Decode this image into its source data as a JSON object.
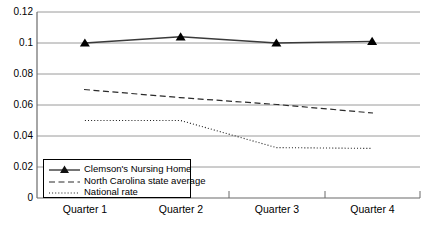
{
  "chart_data": {
    "type": "line",
    "title": "",
    "subtitle": "",
    "xlabel": "",
    "ylabel": "",
    "categories": [
      "Quarter 1",
      "Quarter 2",
      "Quarter 3",
      "Quarter 4"
    ],
    "ylim": [
      0,
      0.12
    ],
    "ytick_labels": [
      "0",
      "0.02",
      "0.04",
      "0.06",
      "0.08",
      "0.1",
      "0.12"
    ],
    "ytick_values": [
      0,
      0.02,
      0.04,
      0.06,
      0.08,
      0.1,
      0.12
    ],
    "grid": true,
    "grid_axis": "y",
    "legend_position": "inside-bottom-left",
    "series": [
      {
        "name": "Clemson's Nursing Home",
        "values": [
          0.1,
          0.104,
          0.1,
          0.101
        ],
        "style": "solid",
        "marker": "triangle",
        "color": "#000000"
      },
      {
        "name": "North Carolina state average",
        "values": [
          0.07,
          0.0635,
          0.059,
          0.0545
        ],
        "style": "dashed",
        "marker": "none",
        "color": "#000000"
      },
      {
        "name": "National rate",
        "values": [
          0.05,
          0.05,
          0.0325,
          0.032
        ],
        "style": "dotted",
        "marker": "none",
        "color": "#000000"
      }
    ]
  },
  "legend": {
    "items": [
      {
        "label": "Clemson's Nursing Home",
        "sample": "solid-line-with-triangle-marker"
      },
      {
        "label": "North Carolina state average",
        "sample": "dashed-line"
      },
      {
        "label": "National rate",
        "sample": "dotted-line"
      }
    ]
  },
  "axes": {
    "y": {
      "ticks": [
        {
          "label": "0.12"
        },
        {
          "label": "0.1"
        },
        {
          "label": "0.08"
        },
        {
          "label": "0.06"
        },
        {
          "label": "0.04"
        },
        {
          "label": "0.02"
        },
        {
          "label": "0"
        }
      ]
    },
    "x": {
      "ticks": [
        {
          "label": "Quarter 1"
        },
        {
          "label": "Quarter 2"
        },
        {
          "label": "Quarter 3"
        },
        {
          "label": "Quarter 4"
        }
      ]
    }
  }
}
